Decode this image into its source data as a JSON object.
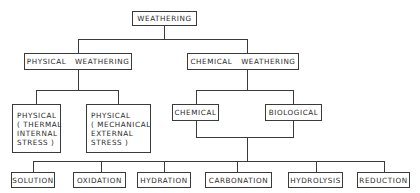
{
  "diagram": {
    "root": {
      "label": "WEATHERING"
    },
    "level1": [
      {
        "label": "PHYSICAL   WEATHERING"
      },
      {
        "label": "CHEMICAL   WEATHERING"
      }
    ],
    "physical_children": [
      {
        "lines": [
          "PHYSICAL",
          "( THERMAL",
          "INTERNAL",
          "STRESS )"
        ]
      },
      {
        "lines": [
          "PHYSICAL",
          "( MECHANICAL",
          "EXTERNAL",
          "STRESS )"
        ]
      }
    ],
    "chemical_children": [
      {
        "label": "CHEMICAL"
      },
      {
        "label": "BIOLOGICAL"
      }
    ],
    "processes": [
      {
        "label": "SOLUTION"
      },
      {
        "label": "OXIDATION"
      },
      {
        "label": "HYDRATION"
      },
      {
        "label": "CARBONATION"
      },
      {
        "label": "HYDROLYSIS"
      },
      {
        "label": "REDUCTION"
      }
    ]
  }
}
